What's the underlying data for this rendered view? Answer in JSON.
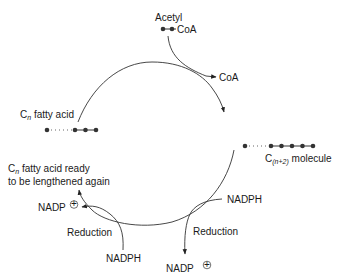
{
  "diagram": {
    "type": "fatty-acid-elongation-cycle",
    "labels": {
      "acetyl": "Acetyl",
      "acetyl_coa": "CoA",
      "coa_released": "CoA",
      "cn_fatty_acid_prefix": "C",
      "cn_fatty_acid_sub": "n",
      "cn_fatty_acid_suffix": " fatty acid",
      "cn2_prefix": "C",
      "cn2_sub": "(n+2)",
      "cn2_suffix": " molecule",
      "ready_line1_prefix": "C",
      "ready_line1_sub": "n",
      "ready_line1_suffix": " fatty acid ready",
      "ready_line2": "to be lengthened again",
      "right_nadph": "NADPH",
      "right_reduction": "Reduction",
      "right_nadp": "NADP",
      "left_nadph": "NADPH",
      "left_reduction": "Reduction",
      "left_nadp": "NADP",
      "plus_symbol": "+"
    },
    "colors": {
      "stroke": "#333333",
      "text": "#1a1a1a",
      "background": "#ffffff"
    },
    "nodes": [
      {
        "id": "acetyl-coa",
        "carbons": 2
      },
      {
        "id": "cn-fatty-acid",
        "carbons": "n"
      },
      {
        "id": "cn2-molecule",
        "carbons": "n+2"
      },
      {
        "id": "cn-fatty-acid-ready",
        "carbons": "n"
      }
    ],
    "edges": [
      {
        "from": "cn-fatty-acid",
        "to": "cn2-molecule",
        "input": "Acetyl-CoA",
        "output": "CoA"
      },
      {
        "from": "cn2-molecule",
        "to": "cn-fatty-acid-ready",
        "step": "Reduction",
        "input": "NADPH",
        "output": "NADP+"
      },
      {
        "from": "cn2-molecule",
        "to": "cn-fatty-acid-ready",
        "step": "Reduction",
        "input": "NADPH",
        "output": "NADP+"
      }
    ]
  }
}
